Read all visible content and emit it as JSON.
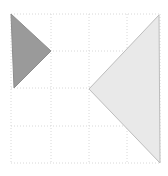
{
  "figure": {
    "title": "",
    "background_color": "#ffffff",
    "width": 168,
    "height": 176
  },
  "grid": {
    "name": "dashed-grid",
    "columns": 4,
    "rows": 4,
    "x_lines": [
      11,
      51,
      89,
      127,
      160
    ],
    "y_lines": [
      14,
      51,
      88,
      126,
      163
    ],
    "line_color": "#d8d8d8",
    "dash_pattern": "1,2",
    "line_width": 1
  },
  "chart_data": {
    "type": "scatter",
    "title": "",
    "xlabel": "",
    "ylabel": "",
    "xlim": [
      11,
      160
    ],
    "ylim": [
      14,
      163
    ],
    "grid": true,
    "legend": "none",
    "shapes": [
      {
        "name": "dark-triangle",
        "label": "Dark gray triangle pointing right",
        "direction": "right",
        "fill": "#9a9a9a",
        "stroke": "#8d8d8d",
        "stroke_width": 1,
        "points": [
          [
            11,
            14
          ],
          [
            51,
            51
          ],
          [
            14,
            88
          ]
        ]
      },
      {
        "name": "light-triangle",
        "label": "Light gray triangle pointing left",
        "direction": "left",
        "fill": "#e9e9e9",
        "stroke": "#bdbdbd",
        "stroke_width": 1,
        "points": [
          [
            159,
            15
          ],
          [
            89,
            89
          ],
          [
            160,
            163
          ]
        ]
      }
    ]
  }
}
